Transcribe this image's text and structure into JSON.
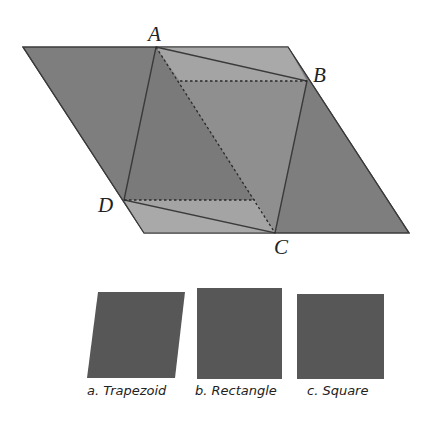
{
  "figure": {
    "vertices": {
      "A": {
        "label": "A",
        "x": 156,
        "y": 47
      },
      "B": {
        "label": "B",
        "x": 307,
        "y": 81
      },
      "C": {
        "label": "C",
        "x": 275,
        "y": 233
      },
      "D": {
        "label": "D",
        "x": 124,
        "y": 200
      }
    },
    "parallelogram": [
      [
        23,
        47
      ],
      [
        288,
        47
      ],
      [
        409,
        233
      ],
      [
        144,
        233
      ]
    ],
    "colors": {
      "outer": "#7e7e7e",
      "light_triangles": "#a9a9a9",
      "inner_left": "#7a7a7a",
      "inner_right": "#8f8f8f",
      "edge": "#3a3a3a",
      "shape_fill": "#575757"
    }
  },
  "options": [
    {
      "label": "a. Trapezoid",
      "shape": "trapezoid"
    },
    {
      "label": "b. Rectangle",
      "shape": "rectangle"
    },
    {
      "label": "c. Square",
      "shape": "square"
    }
  ]
}
